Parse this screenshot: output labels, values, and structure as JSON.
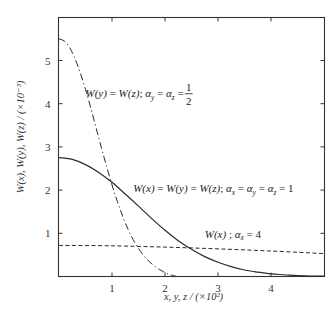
{
  "chart_data": {
    "type": "line",
    "title": "",
    "xlabel": "x, y, z / (×10²)",
    "ylabel": "W(x), W(y), W(z) / (×10⁻³)",
    "xlim": [
      0,
      5
    ],
    "ylim": [
      0,
      6
    ],
    "x_ticks": [
      "1",
      "2",
      "3",
      "4"
    ],
    "y_ticks": [
      "1",
      "2",
      "3",
      "4",
      "5"
    ],
    "grid": false,
    "series": [
      {
        "name": "W(x) = W(y) = W(z); αx = αy = αz = 1",
        "style": "solid",
        "x": [
          0,
          0.25,
          0.5,
          0.75,
          1.0,
          1.25,
          1.5,
          1.75,
          2.0,
          2.25,
          2.5,
          2.75,
          3.0,
          3.25,
          3.5,
          3.75,
          4.0,
          4.25,
          4.5,
          4.75,
          5.0
        ],
        "y": [
          2.75,
          2.71,
          2.59,
          2.41,
          2.18,
          1.91,
          1.63,
          1.34,
          1.07,
          0.83,
          0.63,
          0.46,
          0.33,
          0.23,
          0.15,
          0.1,
          0.06,
          0.04,
          0.02,
          0.01,
          0.01
        ]
      },
      {
        "name": "W(y) = W(z); αy = αz = 1/2",
        "style": "dash-dot",
        "x": [
          0,
          0.1,
          0.2,
          0.3,
          0.4,
          0.5,
          0.6,
          0.7,
          0.8,
          0.9,
          1.0,
          1.1,
          1.2,
          1.3,
          1.4,
          1.5,
          1.6,
          1.7,
          1.8,
          1.9,
          2.0,
          2.1,
          2.2
        ],
        "y": [
          5.5,
          5.45,
          5.3,
          5.05,
          4.72,
          4.33,
          3.9,
          3.44,
          2.98,
          2.54,
          2.12,
          1.74,
          1.4,
          1.1,
          0.85,
          0.65,
          0.48,
          0.35,
          0.24,
          0.16,
          0.09,
          0.04,
          0.01
        ]
      },
      {
        "name": "W(x); αx = 4",
        "style": "dashed",
        "x": [
          0,
          1,
          2,
          3,
          4,
          5
        ],
        "y": [
          0.72,
          0.71,
          0.68,
          0.64,
          0.59,
          0.53
        ]
      }
    ],
    "annotations": [
      {
        "text_parts": [
          "W(y) = W(z); ",
          "α",
          "y",
          " = ",
          "α",
          "z",
          " = "
        ],
        "fraction": {
          "num": "1",
          "den": "2"
        },
        "x": 0.5,
        "y": 4.15
      },
      {
        "text_parts": [
          "W(x) = W(y) = W(z); ",
          "α",
          "x",
          " = ",
          "α",
          "y",
          " = ",
          "α",
          "z",
          " = 1"
        ],
        "x": 1.4,
        "y": 1.95
      },
      {
        "text_parts": [
          "W(x) ; ",
          "α",
          "x",
          " = 4"
        ],
        "x": 2.75,
        "y": 0.9
      }
    ]
  }
}
